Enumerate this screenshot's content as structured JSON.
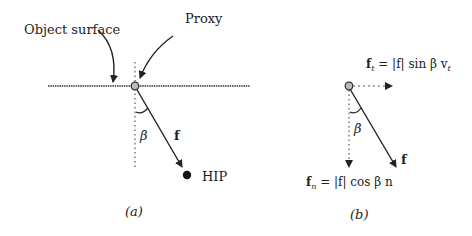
{
  "panel_a": {
    "object_surface_label": "Object surface",
    "proxy_label": "Proxy",
    "angle_label": "β",
    "force_label": "f",
    "hip_label": "HIP",
    "caption": "(a)"
  },
  "panel_b": {
    "ft_lhs": "f",
    "ft_lhs_sub": "t",
    "ft_rhs": "= |f| sin β v",
    "ft_rhs_sub": "t",
    "angle_label": "β",
    "force_label": "f",
    "fn_lhs": "f",
    "fn_lhs_sub": "n",
    "fn_rhs": "= |f| cos β n",
    "caption": "(b)"
  },
  "colors": {
    "ink": "#222222",
    "proxy_fill": "#bbbbbb",
    "background": "#ffffff"
  }
}
